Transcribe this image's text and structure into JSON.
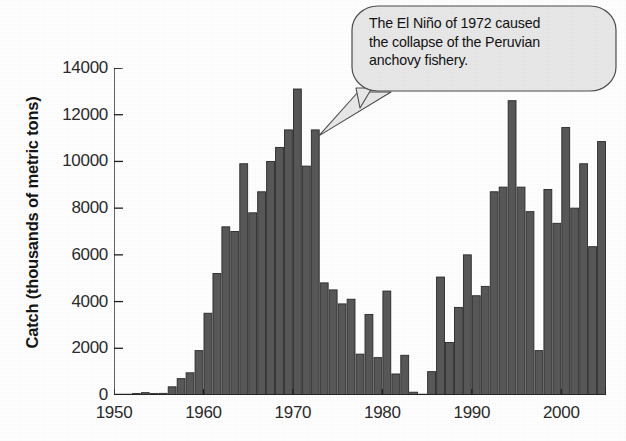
{
  "chart_data": {
    "type": "bar",
    "title": "",
    "xlabel": "",
    "ylabel": "Catch (thousands of metric tons)",
    "ylim": [
      0,
      14000
    ],
    "xlim": [
      1950,
      2005
    ],
    "grid": false,
    "legend": null,
    "y_ticks": [
      0,
      2000,
      4000,
      6000,
      8000,
      10000,
      12000,
      14000
    ],
    "y_tick_labels": [
      "0",
      "2000",
      "4000",
      "6000",
      "8000",
      "10000",
      "12000",
      "14000"
    ],
    "x_ticks": [
      1950,
      1960,
      1970,
      1980,
      1990,
      2000
    ],
    "x_tick_labels": [
      "1950",
      "1960",
      "1970",
      "1980",
      "1990",
      "2000"
    ],
    "bar_color": "#585858",
    "bar_edge_color": "#2a2a2a",
    "categories": [
      1950,
      1951,
      1952,
      1953,
      1954,
      1955,
      1956,
      1957,
      1958,
      1959,
      1960,
      1961,
      1962,
      1963,
      1964,
      1965,
      1966,
      1967,
      1968,
      1969,
      1970,
      1971,
      1972,
      1973,
      1974,
      1975,
      1976,
      1977,
      1978,
      1979,
      1980,
      1981,
      1982,
      1983,
      1984,
      1985,
      1986,
      1987,
      1988,
      1989,
      1990,
      1991,
      1992,
      1993,
      1994,
      1995,
      1996,
      1997,
      1998,
      1999,
      2000,
      2001,
      2002,
      2003,
      2004
    ],
    "values": [
      10,
      20,
      60,
      100,
      60,
      70,
      350,
      700,
      950,
      1900,
      3500,
      5200,
      7200,
      7000,
      9900,
      7800,
      8700,
      10000,
      10600,
      11350,
      13100,
      9800,
      11350,
      4800,
      4500,
      3900,
      4100,
      1750,
      3450,
      1600,
      4450,
      900,
      1700,
      120,
      25,
      1000,
      5050,
      2250,
      3750,
      6000,
      4250,
      4650,
      8700,
      8900,
      12600,
      8900,
      7850,
      1900,
      8800,
      7350,
      11450,
      8000,
      9900,
      6350,
      10850
    ]
  },
  "annotation": {
    "text": "The El Niño of 1972 caused the collapse of the Peruvian anchovy fishery.",
    "line1": "The El Niño of 1972 caused",
    "line2": "the collapse of the Peruvian",
    "line3": "anchovy fishery.",
    "points_to_year": 1972,
    "bubble_fill": "#e8e8e8",
    "bubble_stroke": "#4d4d4d"
  }
}
